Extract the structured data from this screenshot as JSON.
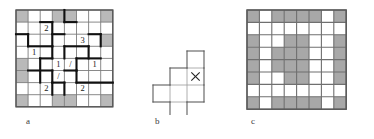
{
  "figure": {
    "panels": [
      {
        "id": "a",
        "label": "a"
      },
      {
        "id": "b",
        "label": "b"
      },
      {
        "id": "c",
        "label": "c"
      }
    ]
  },
  "chart_data": {
    "type": "diagram",
    "title": "",
    "subtitle": "",
    "grid_size": {
      "rows": 8,
      "cols": 8
    },
    "panel_a": {
      "label": "a",
      "rows": 8,
      "cols": 8,
      "shaded_cells": [
        [
          0,
          0
        ],
        [
          0,
          3
        ],
        [
          0,
          4
        ],
        [
          0,
          7
        ],
        [
          2,
          7
        ],
        [
          4,
          0
        ],
        [
          5,
          0
        ],
        [
          7,
          0
        ],
        [
          7,
          3
        ],
        [
          7,
          4
        ],
        [
          7,
          7
        ]
      ],
      "annotations": [
        {
          "row": 1,
          "col": 2,
          "text": "2"
        },
        {
          "row": 2,
          "col": 5,
          "text": "3"
        },
        {
          "row": 3,
          "col": 1,
          "text": "1"
        },
        {
          "row": 4,
          "col": 3,
          "text": "1"
        },
        {
          "row": 4,
          "col": 4,
          "text": "/"
        },
        {
          "row": 4,
          "col": 6,
          "text": "1"
        },
        {
          "row": 5,
          "col": 3,
          "text": "/"
        },
        {
          "row": 6,
          "col": 2,
          "text": "2"
        },
        {
          "row": 6,
          "col": 5,
          "text": "2"
        }
      ],
      "heavy_edges": [
        {
          "type": "h",
          "row": 2,
          "col": 0,
          "len": 1
        },
        {
          "type": "h",
          "row": 2,
          "col": 3,
          "len": 1
        },
        {
          "type": "h",
          "row": 2,
          "col": 6,
          "len": 1
        },
        {
          "type": "h",
          "row": 3,
          "col": 1,
          "len": 2
        },
        {
          "type": "h",
          "row": 3,
          "col": 4,
          "len": 2
        },
        {
          "type": "h",
          "row": 4,
          "col": 2,
          "len": 1
        },
        {
          "type": "h",
          "row": 4,
          "col": 5,
          "len": 2
        },
        {
          "type": "h",
          "row": 5,
          "col": 1,
          "len": 2
        },
        {
          "type": "h",
          "row": 5,
          "col": 4,
          "len": 1
        },
        {
          "type": "h",
          "row": 6,
          "col": 3,
          "len": 1
        },
        {
          "type": "h",
          "row": 6,
          "col": 5,
          "len": 3
        },
        {
          "type": "h",
          "row": 1,
          "col": 2,
          "len": 1
        },
        {
          "type": "h",
          "row": 1,
          "col": 4,
          "len": 1
        },
        {
          "type": "v",
          "row": 1,
          "col": 3,
          "len": 2
        },
        {
          "type": "v",
          "row": 0,
          "col": 4,
          "len": 1
        },
        {
          "type": "v",
          "row": 2,
          "col": 1,
          "len": 1
        },
        {
          "type": "v",
          "row": 3,
          "col": 3,
          "len": 1
        },
        {
          "type": "v",
          "row": 3,
          "col": 4,
          "len": 1
        },
        {
          "type": "v",
          "row": 3,
          "col": 6,
          "len": 1
        },
        {
          "type": "v",
          "row": 4,
          "col": 2,
          "len": 2
        },
        {
          "type": "v",
          "row": 4,
          "col": 5,
          "len": 1
        },
        {
          "type": "v",
          "row": 5,
          "col": 3,
          "len": 1
        },
        {
          "type": "v",
          "row": 5,
          "col": 5,
          "len": 1
        },
        {
          "type": "v",
          "row": 6,
          "col": 3,
          "len": 1
        },
        {
          "type": "v",
          "row": 6,
          "col": 4,
          "len": 1
        },
        {
          "type": "v",
          "row": 2,
          "col": 7,
          "len": 1
        }
      ]
    },
    "panel_b": {
      "label": "b",
      "marker": "X",
      "marker_cell": [
        1,
        2
      ],
      "tile_cells": [
        [
          0,
          2
        ],
        [
          1,
          1
        ],
        [
          1,
          2
        ],
        [
          2,
          0
        ],
        [
          2,
          1
        ],
        [
          2,
          2
        ],
        [
          3,
          1
        ]
      ],
      "description": "Single polyomino tile outlined in thin black line, with an X drawn in the cell at the upper-right of the tile."
    },
    "panel_c": {
      "label": "c",
      "rows": 8,
      "cols": 8,
      "shaded_cells": [
        [
          0,
          0
        ],
        [
          0,
          2
        ],
        [
          0,
          3
        ],
        [
          0,
          4
        ],
        [
          0,
          5
        ],
        [
          0,
          7
        ],
        [
          2,
          0
        ],
        [
          2,
          3
        ],
        [
          2,
          4
        ],
        [
          2,
          7
        ],
        [
          3,
          0
        ],
        [
          3,
          2
        ],
        [
          3,
          3
        ],
        [
          3,
          4
        ],
        [
          3,
          7
        ],
        [
          4,
          0
        ],
        [
          4,
          2
        ],
        [
          4,
          3
        ],
        [
          4,
          4
        ],
        [
          4,
          7
        ],
        [
          5,
          0
        ],
        [
          5,
          3
        ],
        [
          5,
          4
        ],
        [
          5,
          7
        ],
        [
          7,
          0
        ],
        [
          7,
          2
        ],
        [
          7,
          3
        ],
        [
          7,
          4
        ],
        [
          7,
          5
        ],
        [
          7,
          7
        ]
      ]
    }
  }
}
